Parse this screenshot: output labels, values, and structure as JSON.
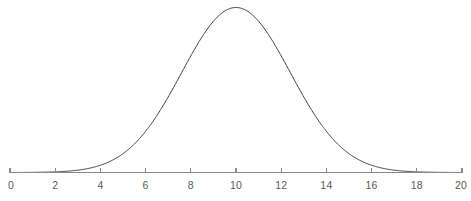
{
  "chart_data": {
    "type": "line",
    "title": "",
    "subtitle": "",
    "xlabel": "",
    "ylabel": "",
    "xlim": [
      0,
      20
    ],
    "ylim": [
      0,
      1
    ],
    "grid": false,
    "legend": null,
    "annotations": [],
    "xticks": [
      0,
      2,
      4,
      6,
      8,
      10,
      12,
      14,
      16,
      18,
      20
    ],
    "xtick_labels": [
      "0",
      "2",
      "4",
      "6",
      "8",
      "10",
      "12",
      "14",
      "16",
      "18",
      "20"
    ],
    "yticks": [],
    "ytick_labels": [],
    "axis_only_x": true,
    "curve_color": "#3b3b3b",
    "axis_color": "#8a8a8a",
    "label_color": "#5a5a5a",
    "background_color": "#ffffff",
    "series": [
      {
        "name": "normal distribution",
        "distribution": "gaussian",
        "mean": 10,
        "sigma": 2.4,
        "peak_value": 1,
        "x": [
          0,
          0.5,
          1,
          1.5,
          2,
          2.5,
          3,
          3.5,
          4,
          4.5,
          5,
          5.5,
          6,
          6.5,
          7,
          7.5,
          8,
          8.5,
          9,
          9.5,
          10,
          10.5,
          11,
          11.5,
          12,
          12.5,
          13,
          13.5,
          14,
          14.5,
          15,
          15.5,
          16,
          16.5,
          17,
          17.5,
          18,
          18.5,
          19,
          19.5,
          20
        ],
        "values": [
          0.0,
          0.0001,
          0.0002,
          0.0005,
          0.0011,
          0.0024,
          0.0048,
          0.0091,
          0.0163,
          0.0277,
          0.0447,
          0.0687,
          0.1003,
          0.1393,
          0.184,
          0.2313,
          0.277,
          0.3163,
          0.3444,
          0.3601,
          0.3648,
          0.3601,
          0.3444,
          0.3163,
          0.277,
          0.2313,
          0.184,
          0.1393,
          0.1003,
          0.0687,
          0.0447,
          0.0277,
          0.0163,
          0.0091,
          0.0048,
          0.0024,
          0.0011,
          0.0005,
          0.0002,
          0.0001,
          0.0
        ]
      }
    ]
  },
  "figure": {
    "axis_label": "number-line-axis",
    "curve_label": "bell-curve"
  }
}
